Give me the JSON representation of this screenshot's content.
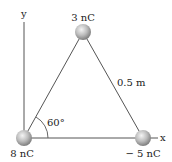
{
  "diagram": {
    "axes": {
      "x_label": "x",
      "y_label": "y"
    },
    "charges": [
      {
        "id": "top",
        "label": "3 nC"
      },
      {
        "id": "origin",
        "label": "8 nC"
      },
      {
        "id": "right",
        "label": "− 5 nC"
      }
    ],
    "side_length_label": "0.5 m",
    "angle_label": "60°"
  },
  "colors": {
    "line": "#555555",
    "sphere_light": "#f2f2f2",
    "sphere_dark": "#8a8a8a",
    "text": "#222222"
  }
}
